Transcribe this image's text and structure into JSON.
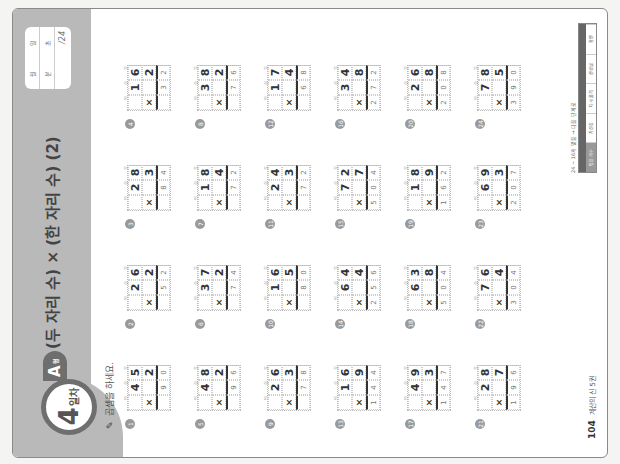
{
  "page": {
    "day_badge": {
      "number": "4",
      "word": "일차"
    },
    "level_tab": {
      "letter": "A",
      "suffix": "형"
    },
    "title": "(두 자리 수) × (한 자리 수) (2)",
    "score_box": {
      "date_labels": [
        "월",
        "일"
      ],
      "time_labels": [
        "분",
        "초"
      ],
      "total": "/24"
    },
    "instruction": {
      "icon": "pencil-icon",
      "text": "곱셈을 하세요."
    },
    "place_labels": [
      "백",
      "십",
      "일"
    ],
    "footer": {
      "page_number": "104",
      "book_title": "계산의 신 5권"
    },
    "grading": {
      "caption": "24 ~ 16개 맞음 → 다음 단계로",
      "headers": [
        "",
        "",
        "",
        "",
        ""
      ],
      "cells": [
        "맞은 개수",
        "자신감",
        "다시 풀기",
        "선생님",
        "확인"
      ]
    }
  },
  "problems": [
    {
      "num": "1",
      "top": [
        "",
        "4",
        "5"
      ],
      "mult": [
        "×",
        "",
        "2"
      ],
      "answer": [
        "",
        "9",
        "0"
      ]
    },
    {
      "num": "2",
      "top": [
        "",
        "2",
        "6"
      ],
      "mult": [
        "×",
        "",
        "2"
      ],
      "answer": [
        "",
        "5",
        "2"
      ]
    },
    {
      "num": "3",
      "top": [
        "",
        "2",
        "8"
      ],
      "mult": [
        "×",
        "",
        "3"
      ],
      "answer": [
        "",
        "8",
        "4"
      ]
    },
    {
      "num": "4",
      "top": [
        "",
        "1",
        "6"
      ],
      "mult": [
        "×",
        "",
        "2"
      ],
      "answer": [
        "",
        "3",
        "2"
      ]
    },
    {
      "num": "5",
      "top": [
        "",
        "4",
        "8"
      ],
      "mult": [
        "×",
        "",
        "2"
      ],
      "answer": [
        "",
        "9",
        "6"
      ]
    },
    {
      "num": "6",
      "top": [
        "",
        "3",
        "7"
      ],
      "mult": [
        "×",
        "",
        "2"
      ],
      "answer": [
        "",
        "7",
        "4"
      ]
    },
    {
      "num": "7",
      "top": [
        "",
        "1",
        "8"
      ],
      "mult": [
        "×",
        "",
        "4"
      ],
      "answer": [
        "",
        "7",
        "2"
      ]
    },
    {
      "num": "8",
      "top": [
        "",
        "3",
        "8"
      ],
      "mult": [
        "×",
        "",
        "2"
      ],
      "answer": [
        "",
        "7",
        "6"
      ]
    },
    {
      "num": "9",
      "top": [
        "",
        "2",
        "6"
      ],
      "mult": [
        "×",
        "",
        "3"
      ],
      "answer": [
        "",
        "7",
        "8"
      ]
    },
    {
      "num": "10",
      "top": [
        "",
        "1",
        "6"
      ],
      "mult": [
        "×",
        "",
        "5"
      ],
      "answer": [
        "",
        "8",
        "0"
      ]
    },
    {
      "num": "11",
      "top": [
        "",
        "2",
        "4"
      ],
      "mult": [
        "×",
        "",
        "3"
      ],
      "answer": [
        "",
        "7",
        "2"
      ]
    },
    {
      "num": "12",
      "top": [
        "",
        "1",
        "7"
      ],
      "mult": [
        "×",
        "",
        "4"
      ],
      "answer": [
        "",
        "6",
        "8"
      ]
    },
    {
      "num": "13",
      "top": [
        "",
        "1",
        "6"
      ],
      "mult": [
        "×",
        "",
        "9"
      ],
      "answer": [
        "1",
        "4",
        "4"
      ]
    },
    {
      "num": "14",
      "top": [
        "",
        "6",
        "4"
      ],
      "mult": [
        "×",
        "",
        "4"
      ],
      "answer": [
        "2",
        "5",
        "6"
      ]
    },
    {
      "num": "15",
      "top": [
        "",
        "7",
        "2"
      ],
      "mult": [
        "×",
        "",
        "7"
      ],
      "answer": [
        "5",
        "0",
        "4"
      ]
    },
    {
      "num": "16",
      "top": [
        "",
        "3",
        "4"
      ],
      "mult": [
        "×",
        "",
        "8"
      ],
      "answer": [
        "2",
        "7",
        "2"
      ]
    },
    {
      "num": "17",
      "top": [
        "",
        "4",
        "9"
      ],
      "mult": [
        "×",
        "",
        "3"
      ],
      "answer": [
        "1",
        "4",
        "7"
      ]
    },
    {
      "num": "18",
      "top": [
        "",
        "6",
        "3"
      ],
      "mult": [
        "×",
        "",
        "8"
      ],
      "answer": [
        "5",
        "0",
        "4"
      ]
    },
    {
      "num": "19",
      "top": [
        "",
        "1",
        "8"
      ],
      "mult": [
        "×",
        "",
        "9"
      ],
      "answer": [
        "1",
        "6",
        "2"
      ]
    },
    {
      "num": "20",
      "top": [
        "",
        "2",
        "6"
      ],
      "mult": [
        "×",
        "",
        "8"
      ],
      "answer": [
        "2",
        "0",
        "8"
      ]
    },
    {
      "num": "21",
      "top": [
        "",
        "2",
        "8"
      ],
      "mult": [
        "×",
        "",
        "7"
      ],
      "answer": [
        "1",
        "9",
        "6"
      ]
    },
    {
      "num": "22",
      "top": [
        "",
        "7",
        "6"
      ],
      "mult": [
        "×",
        "",
        "4"
      ],
      "answer": [
        "3",
        "0",
        "4"
      ]
    },
    {
      "num": "23",
      "top": [
        "",
        "6",
        "9"
      ],
      "mult": [
        "×",
        "",
        "3"
      ],
      "answer": [
        "2",
        "0",
        "7"
      ]
    },
    {
      "num": "24",
      "top": [
        "",
        "7",
        "8"
      ],
      "mult": [
        "×",
        "",
        "5"
      ],
      "answer": [
        "3",
        "9",
        "0"
      ]
    }
  ]
}
